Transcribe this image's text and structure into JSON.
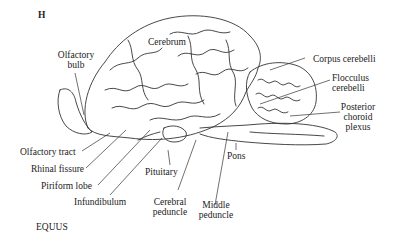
{
  "figure": {
    "panel_letter": "H",
    "species": "EQUUS"
  },
  "labels": {
    "cerebrum": "Cerebrum",
    "olfactory_bulb_1": "Olfactory",
    "olfactory_bulb_2": "bulb",
    "corpus_cerebelli": "Corpus cerebelli",
    "flocculus_1": "Flocculus",
    "flocculus_2": "cerebelli",
    "posterior_choroid_1": "Posterior",
    "posterior_choroid_2": "choroid",
    "posterior_choroid_3": "plexus",
    "olfactory_tract": "Olfactory tract",
    "rhinal_fissure": "Rhinal fissure",
    "piriform_lobe": "Piriform lobe",
    "infundibulum": "Infundibulum",
    "pituitary": "Pituitary",
    "cerebral_peduncle_1": "Cerebral",
    "cerebral_peduncle_2": "peduncle",
    "middle_peduncle_1": "Middle",
    "middle_peduncle_2": "peduncle",
    "pons": "Pons"
  }
}
